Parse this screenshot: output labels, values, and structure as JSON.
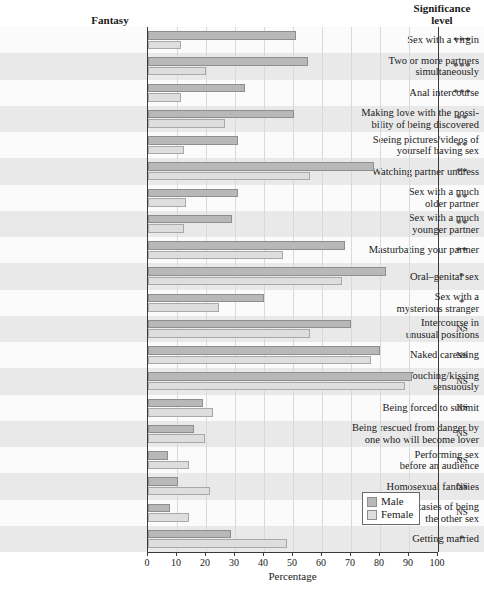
{
  "headers": {
    "fantasy": "Fantasy",
    "significance_line1": "Significance",
    "significance_line2": "level"
  },
  "axis": {
    "xlabel": "Percentage",
    "ticks": [
      0,
      10,
      20,
      30,
      40,
      50,
      60,
      70,
      80,
      90,
      100
    ],
    "tick_labels": [
      "0",
      "10",
      "20",
      "30",
      "40",
      "50",
      "60",
      "70",
      "80",
      "90",
      "100"
    ]
  },
  "legend": {
    "male": "Male",
    "female": "Female",
    "male_color": "#b8b8b8",
    "female_color": "#dedede"
  },
  "chart_data": {
    "type": "bar",
    "title": "",
    "subtitle": "",
    "orientation": "horizontal",
    "xlabel": "Percentage",
    "ylabel": "Fantasy",
    "xlim": [
      0,
      100
    ],
    "grid": true,
    "legend_position": "bottom-right",
    "categories": [
      "Sex with a virgin",
      "Two or more partners simultaneously",
      "Anal intercourse",
      "Making love with the possibility of being discovered",
      "Seeing pictures/videos of yourself having sex",
      "Watching partner undress",
      "Sex with a much older partner",
      "Sex with a much younger partner",
      "Masturbating your partner",
      "Oral–genital sex",
      "Sex with a mysterious stranger",
      "Intercourse in unusual positions",
      "Naked caressing",
      "Touching/kissing sensuously",
      "Being forced to submit",
      "Being rescued from danger by one who will become lover",
      "Performing sex before an audience",
      "Homosexual fantasies",
      "Fantasies of being the other sex",
      "Getting married"
    ],
    "category_lines": [
      [
        "Sex with a virgin"
      ],
      [
        "Two or more partners",
        "simultaneously"
      ],
      [
        "Anal intercourse"
      ],
      [
        "Making love with the possi-",
        "bility of being discovered"
      ],
      [
        "Seeing pictures/videos of",
        "yourself having sex"
      ],
      [
        "Watching partner undress"
      ],
      [
        "Sex with a much",
        "older partner"
      ],
      [
        "Sex with a much",
        "younger partner"
      ],
      [
        "Masturbating your partner"
      ],
      [
        "Oral–genital sex"
      ],
      [
        "Sex with a",
        "mysterious stranger"
      ],
      [
        "Intercourse in",
        "unusual positions"
      ],
      [
        "Naked caressing"
      ],
      [
        "Touching/kissing",
        "sensuously"
      ],
      [
        "Being forced to submit"
      ],
      [
        "Being rescued from danger by",
        "one who will become lover"
      ],
      [
        "Performing sex",
        "before an audience"
      ],
      [
        "Homosexual fantasies"
      ],
      [
        "Fantasies of being",
        "the other sex"
      ],
      [
        "Getting married"
      ]
    ],
    "series": [
      {
        "name": "Male",
        "values": [
          51,
          55,
          33.5,
          50.5,
          31,
          78,
          31,
          29,
          68,
          82,
          40,
          70,
          80,
          91,
          19,
          16,
          7,
          10.5,
          7.5,
          28.5
        ]
      },
      {
        "name": "Female",
        "values": [
          11.5,
          20,
          11.5,
          26.5,
          12.5,
          56,
          13,
          12.5,
          46.5,
          67,
          24.5,
          56,
          77,
          88.5,
          22.5,
          19.5,
          14,
          21.5,
          14,
          48
        ]
      }
    ],
    "significance": [
      "***",
      "***",
      "***",
      "**",
      "**",
      "**",
      "**",
      "**",
      "**",
      "*",
      "*",
      "NS",
      "NS",
      "NS",
      "NS",
      "NS",
      "NS",
      "NS",
      "NS",
      "*"
    ]
  }
}
